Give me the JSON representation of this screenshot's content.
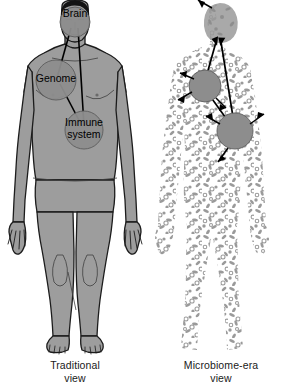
{
  "figure": {
    "background_color": "#ffffff",
    "body_fill": "#9d9d9d",
    "body_outline": "#1c1c1c",
    "hair_color": "#131313",
    "node_fill": "#8d8d8d",
    "node_outline": "#4a4a4a",
    "microbe_color": "#9a9a9a",
    "arrow_color": "#000000",
    "text_color": "#000000"
  },
  "panels": [
    {
      "id": "traditional",
      "caption_line1": "Traditional",
      "caption_line2": "view",
      "labels": [
        {
          "id": "brain",
          "text": "Brain"
        },
        {
          "id": "genome",
          "text": "Genome"
        },
        {
          "id": "immune",
          "text": "Immune system"
        }
      ],
      "nodes": [
        {
          "name": "brain-node",
          "cx": 75,
          "cy": 22,
          "r": 15
        },
        {
          "name": "genome-node",
          "cx": 56,
          "cy": 80,
          "r": 20
        },
        {
          "name": "immune-node",
          "cx": 84,
          "cy": 130,
          "r": 19
        }
      ],
      "connectors": [
        {
          "from": "brain",
          "to": "genome"
        },
        {
          "from": "brain",
          "to": "immune"
        },
        {
          "from": "genome",
          "to": "immune"
        }
      ]
    },
    {
      "id": "microbiome",
      "caption_line1": "Microbiome-era",
      "caption_line2": "view",
      "labels": [],
      "nodes": [
        {
          "name": "head-mass",
          "cx": 70,
          "cy": 26,
          "r": 19
        },
        {
          "name": "upper-circle",
          "cx": 55,
          "cy": 86,
          "r": 16
        },
        {
          "name": "lower-circle",
          "cx": 85,
          "cy": 131,
          "r": 18
        }
      ],
      "connectors": [
        {
          "from": "head-mass",
          "to": "upper-circle",
          "double_headed": true
        },
        {
          "from": "head-mass",
          "to": "lower-circle",
          "double_headed": true
        },
        {
          "from": "upper-circle",
          "to": "lower-circle",
          "double_headed": true
        }
      ],
      "radiating_arrow_count": 7
    }
  ]
}
